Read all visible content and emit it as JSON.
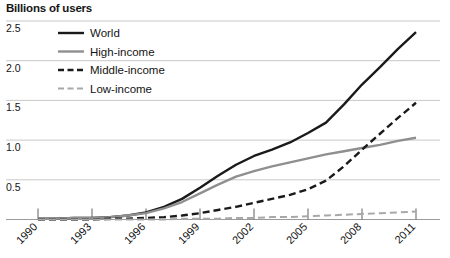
{
  "chart_data": {
    "type": "line",
    "title": "Billions of users",
    "xlabel": "",
    "ylabel": "Billions of users",
    "xlim": [
      1990,
      2011
    ],
    "ylim": [
      0,
      2.5
    ],
    "grid": true,
    "legend_position": "top-left",
    "y_ticks": [
      "0.5",
      "1.0",
      "1.5",
      "2.0",
      "2.5"
    ],
    "y_tick_values": [
      0.5,
      1.0,
      1.5,
      2.0,
      2.5
    ],
    "x_ticks": [
      "1990",
      "1993",
      "1996",
      "1999",
      "2002",
      "2005",
      "2008",
      "2011"
    ],
    "x_tick_values": [
      1990,
      1993,
      1996,
      1999,
      2002,
      2005,
      2008,
      2011
    ],
    "x": [
      1990,
      1991,
      1992,
      1993,
      1994,
      1995,
      1996,
      1997,
      1998,
      1999,
      2000,
      2001,
      2002,
      2003,
      2004,
      2005,
      2006,
      2007,
      2008,
      2009,
      2010,
      2011
    ],
    "series": [
      {
        "name": "World",
        "style": "solid",
        "color": "#1a1a1a",
        "width": 2.4,
        "values": [
          0.01,
          0.01,
          0.02,
          0.02,
          0.03,
          0.05,
          0.09,
          0.16,
          0.26,
          0.4,
          0.55,
          0.69,
          0.8,
          0.88,
          0.97,
          1.09,
          1.22,
          1.45,
          1.7,
          1.92,
          2.15,
          2.36
        ]
      },
      {
        "name": "High-income",
        "style": "solid",
        "color": "#8f8f8f",
        "width": 2.4,
        "values": [
          0.01,
          0.01,
          0.02,
          0.02,
          0.03,
          0.05,
          0.08,
          0.14,
          0.22,
          0.33,
          0.44,
          0.54,
          0.61,
          0.67,
          0.72,
          0.77,
          0.82,
          0.86,
          0.9,
          0.94,
          0.99,
          1.03
        ]
      },
      {
        "name": "Middle-income",
        "style": "dashed",
        "color": "#1a1a1a",
        "width": 2.4,
        "values": [
          0.0,
          0.0,
          0.0,
          0.0,
          0.01,
          0.01,
          0.02,
          0.03,
          0.05,
          0.08,
          0.12,
          0.16,
          0.21,
          0.26,
          0.31,
          0.38,
          0.49,
          0.67,
          0.88,
          1.08,
          1.28,
          1.47
        ]
      },
      {
        "name": "Low-income",
        "style": "dashed",
        "color": "#a8a8a8",
        "width": 2.0,
        "values": [
          0.0,
          0.0,
          0.0,
          0.0,
          0.0,
          0.0,
          0.0,
          0.0,
          0.01,
          0.01,
          0.01,
          0.02,
          0.02,
          0.03,
          0.03,
          0.04,
          0.05,
          0.06,
          0.07,
          0.08,
          0.09,
          0.1
        ]
      }
    ],
    "legend": [
      {
        "label": "World",
        "style": "solid",
        "color": "#1a1a1a"
      },
      {
        "label": "High-income",
        "style": "solid",
        "color": "#8f8f8f"
      },
      {
        "label": "Middle-income",
        "style": "dashed",
        "color": "#1a1a1a"
      },
      {
        "label": "Low-income",
        "style": "dashed",
        "color": "#a8a8a8"
      }
    ],
    "colors": {
      "grid": "#c9c9c9",
      "axis": "#9a9a9a",
      "text": "#141414",
      "background": "#ffffff"
    }
  }
}
